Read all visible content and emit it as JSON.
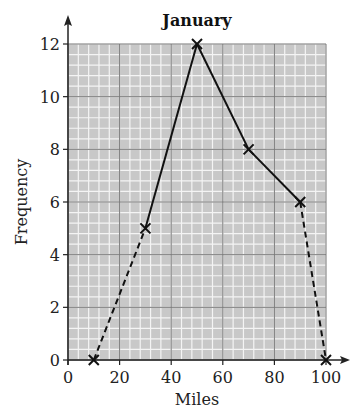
{
  "chart_data": {
    "type": "line",
    "subtype": "frequency-polygon",
    "title": "January",
    "xlabel": "Miles",
    "ylabel": "Frequency",
    "xlim": [
      0,
      100
    ],
    "ylim": [
      0,
      12
    ],
    "x_ticks": [
      0,
      20,
      40,
      60,
      80,
      100
    ],
    "y_ticks": [
      0,
      2,
      4,
      6,
      8,
      10,
      12
    ],
    "grid": true,
    "grid_minor_x_step": 4,
    "grid_minor_y_step": 0.4,
    "series": [
      {
        "name": "January",
        "points": [
          {
            "x": 10,
            "y": 0
          },
          {
            "x": 30,
            "y": 5
          },
          {
            "x": 50,
            "y": 12
          },
          {
            "x": 70,
            "y": 8
          },
          {
            "x": 90,
            "y": 6
          },
          {
            "x": 100,
            "y": 0
          }
        ],
        "segment_styles": [
          "dashed",
          "solid",
          "solid",
          "solid",
          "dashed"
        ],
        "marker": "x"
      }
    ]
  },
  "colors": {
    "grid_background": "#c8c8c8",
    "minor_grid": "#f4f4f4",
    "major_grid": "#7a7a7a",
    "line": "#111111"
  }
}
